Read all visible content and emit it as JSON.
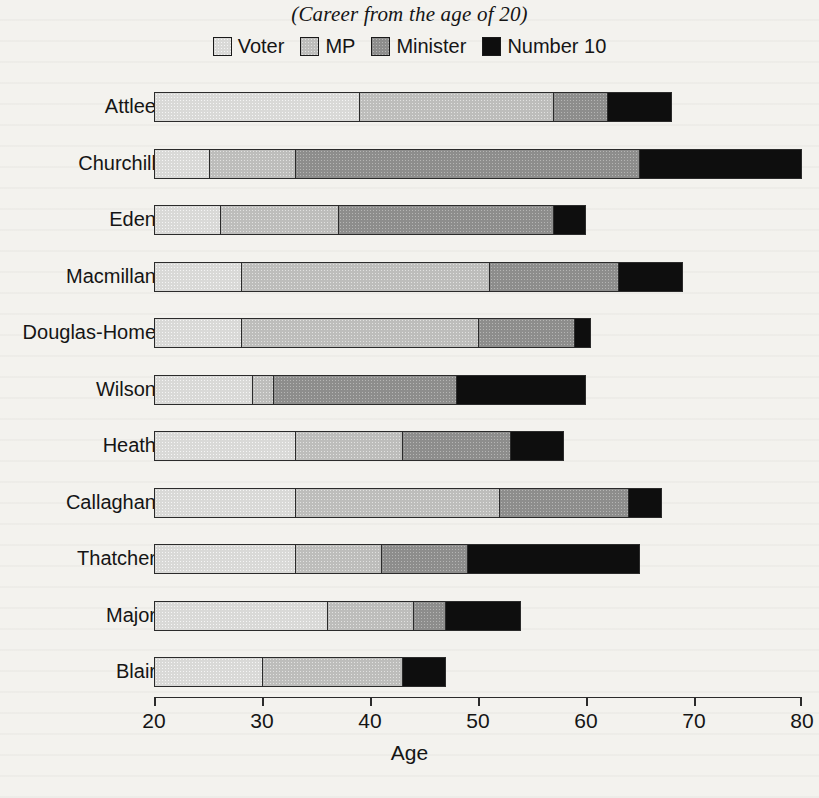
{
  "subtitle": "(Career from the age of 20)",
  "legend": {
    "items": [
      {
        "label": "Voter",
        "key": "voter",
        "color": "#d9d9d7",
        "swatch_name": "legend-swatch-voter"
      },
      {
        "label": "MP",
        "key": "mp",
        "color": "#bdbdbb",
        "swatch_name": "legend-swatch-mp"
      },
      {
        "label": "Minister",
        "key": "minister",
        "color": "#8d8d8c",
        "swatch_name": "legend-swatch-minister"
      },
      {
        "label": "Number 10",
        "key": "number10",
        "color": "#0e0e0e",
        "swatch_name": "legend-swatch-number10"
      }
    ]
  },
  "axis": {
    "title": "Age",
    "ticks": [
      "20",
      "30",
      "40",
      "50",
      "60",
      "70",
      "80"
    ],
    "min": 20,
    "max": 80
  },
  "chart_data": {
    "type": "bar",
    "orientation": "horizontal",
    "stacked": true,
    "title": "",
    "subtitle": "(Career from the age of 20)",
    "xlabel": "Age",
    "ylabel": "",
    "xlim": [
      20,
      80
    ],
    "xticks": [
      20,
      30,
      40,
      50,
      60,
      70,
      80
    ],
    "grid": false,
    "legend_position": "top-center",
    "categories": [
      "Attlee",
      "Churchill",
      "Eden",
      "Macmillan",
      "Douglas-Home",
      "Wilson",
      "Heath",
      "Callaghan",
      "Thatcher",
      "Major",
      "Blair"
    ],
    "series": [
      {
        "name": "Voter",
        "values": [
          19,
          5,
          6,
          8,
          8,
          9,
          12,
          13,
          13,
          16,
          10
        ]
      },
      {
        "name": "MP",
        "values": [
          18,
          8,
          11,
          23,
          22,
          2,
          10,
          19,
          8,
          8,
          13
        ]
      },
      {
        "name": "Minister",
        "values": [
          5,
          32,
          20,
          12,
          9,
          17,
          10,
          12,
          8,
          3,
          0
        ]
      },
      {
        "name": "Number 10",
        "values": [
          6,
          15,
          3,
          6,
          1,
          12,
          5,
          3,
          11,
          7,
          4
        ]
      }
    ],
    "stack_boundaries_age": {
      "Attlee": {
        "start": 20,
        "voter_end": 39,
        "mp_end": 57,
        "minister_end": 62,
        "end": 68
      },
      "Churchill": {
        "start": 20,
        "voter_end": 25,
        "mp_end": 33,
        "minister_end": 65,
        "end": 80
      },
      "Eden": {
        "start": 20,
        "voter_end": 26,
        "mp_end": 37,
        "minister_end": 57,
        "end": 60
      },
      "Macmillan": {
        "start": 20,
        "voter_end": 28,
        "mp_end": 51,
        "minister_end": 63,
        "end": 69
      },
      "Douglas-Home": {
        "start": 20,
        "voter_end": 28,
        "mp_end": 50,
        "minister_end": 59,
        "end": 60.5
      },
      "Wilson": {
        "start": 20,
        "voter_end": 29,
        "mp_end": 31,
        "minister_end": 48,
        "end": 60
      },
      "Heath": {
        "start": 20,
        "voter_end": 33,
        "mp_end": 43,
        "minister_end": 53,
        "end": 58
      },
      "Callaghan": {
        "start": 20,
        "voter_end": 33,
        "mp_end": 52,
        "minister_end": 64,
        "end": 67
      },
      "Thatcher": {
        "start": 20,
        "voter_end": 33,
        "mp_end": 41,
        "minister_end": 49,
        "end": 65
      },
      "Major": {
        "start": 20,
        "voter_end": 36,
        "mp_end": 44,
        "minister_end": 47,
        "end": 54
      },
      "Blair": {
        "start": 20,
        "voter_end": 30,
        "mp_end": 43,
        "minister_end": 43,
        "end": 47
      }
    }
  },
  "rows": [
    {
      "label": "Attlee",
      "voter": [
        20,
        39
      ],
      "mp": [
        39,
        57
      ],
      "minister": [
        57,
        62
      ],
      "number10": [
        62,
        68
      ]
    },
    {
      "label": "Churchill",
      "voter": [
        20,
        25
      ],
      "mp": [
        25,
        33
      ],
      "minister": [
        33,
        65
      ],
      "number10": [
        65,
        80
      ]
    },
    {
      "label": "Eden",
      "voter": [
        20,
        26
      ],
      "mp": [
        26,
        37
      ],
      "minister": [
        37,
        57
      ],
      "number10": [
        57,
        60
      ]
    },
    {
      "label": "Macmillan",
      "voter": [
        20,
        28
      ],
      "mp": [
        28,
        51
      ],
      "minister": [
        51,
        63
      ],
      "number10": [
        63,
        69
      ]
    },
    {
      "label": "Douglas-Home",
      "voter": [
        20,
        28
      ],
      "mp": [
        28,
        50
      ],
      "minister": [
        50,
        59
      ],
      "number10": [
        59,
        60.5
      ]
    },
    {
      "label": "Wilson",
      "voter": [
        20,
        29
      ],
      "mp": [
        29,
        31
      ],
      "minister": [
        31,
        48
      ],
      "number10": [
        48,
        60
      ]
    },
    {
      "label": "Heath",
      "voter": [
        20,
        33
      ],
      "mp": [
        33,
        43
      ],
      "minister": [
        43,
        53
      ],
      "number10": [
        53,
        58
      ]
    },
    {
      "label": "Callaghan",
      "voter": [
        20,
        33
      ],
      "mp": [
        33,
        52
      ],
      "minister": [
        52,
        64
      ],
      "number10": [
        64,
        67
      ]
    },
    {
      "label": "Thatcher",
      "voter": [
        20,
        33
      ],
      "mp": [
        33,
        41
      ],
      "minister": [
        41,
        49
      ],
      "number10": [
        49,
        65
      ]
    },
    {
      "label": "Major",
      "voter": [
        20,
        36
      ],
      "mp": [
        36,
        44
      ],
      "minister": [
        44,
        47
      ],
      "number10": [
        47,
        54
      ]
    },
    {
      "label": "Blair",
      "voter": [
        20,
        30
      ],
      "mp": [
        30,
        43
      ],
      "minister": [
        43,
        43
      ],
      "number10": [
        43,
        47
      ]
    }
  ]
}
